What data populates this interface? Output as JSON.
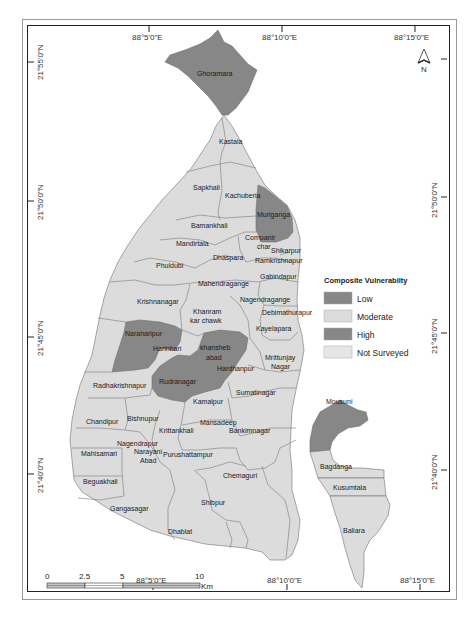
{
  "map": {
    "title": "Composite Vulnerability Map",
    "colors": {
      "low": "#878787",
      "moderate": "#dcdcdc",
      "high": "#878787",
      "not_surveyed": "#e6e6e6",
      "boundary": "#707070",
      "frame": "#222222"
    },
    "axes": {
      "top_longitudes": [
        "88°5'0\"E",
        "88°10'0\"E",
        "88°15'0\"E"
      ],
      "bottom_longitudes": [
        "88°5'0\"E",
        "88°10'0\"E",
        "88°15'0\"E"
      ],
      "left_latitudes": [
        "21°55'0\"N",
        "21°50'0\"N",
        "21°45'0\"N",
        "21°40'0\"N"
      ],
      "right_latitudes": [
        "21°50'0\"N",
        "21°45'0\"N",
        "21°40'0\"N"
      ]
    },
    "north_arrow": {
      "label": "N",
      "icon": "north-arrow-icon"
    },
    "legend": {
      "title": "Composite Vulnerabilty",
      "items": [
        {
          "label": "Low",
          "color": "#878787"
        },
        {
          "label": "Moderate",
          "color": "#dcdcdc"
        },
        {
          "label": "High",
          "color": "#878787"
        },
        {
          "label": "Not Surveyed",
          "color": "#e6e6e6"
        }
      ]
    },
    "scale_bar": {
      "ticks": [
        "0",
        "2.5",
        "5",
        "10"
      ],
      "unit": "Km"
    },
    "regions": {
      "ghoramara": "Ghoramara",
      "kastala": "Kastala",
      "sapkhali": "Sapkhali",
      "kachuberia": "Kachuberia",
      "muriganga": "Muriganga",
      "bamankhali": "Bamankhali",
      "companir_char_1": "Companir",
      "companir_char_2": "char",
      "mandirtala": "Mandirtala",
      "shikarpur": "Shikarpur",
      "ramkrishnapur": "Ramkrishnapur",
      "phuldubi": "Phuldubi",
      "dhaspara": "Dhaspara",
      "gabindapur": "Gabindapur",
      "mahendragange": "Mahendragange",
      "krishnanagar": "Krishnanagar",
      "nagendragange": "Nagendragange",
      "debimathurapur": "Debimathurapur",
      "khanram_1": "Khanram",
      "khanram_2": "kar chawk",
      "kayelapara": "Kayelapara",
      "naraharipur": "Naraharipur",
      "harinbari": "Harinbari",
      "khansheb_1": "khansheb",
      "khansheb_2": "abad",
      "mrittunjay_1": "Mrittunjay",
      "mrittunjay_2": "Nagar",
      "hardhanpur": "Hardhanpur",
      "radhakrishnapur": "Radhakrishnapur",
      "rudranagar": "Rudranagar",
      "sumatinagar": "Sumatinagar",
      "kamalpur": "Kamalpur",
      "chandipur": "Chandipur",
      "bishnupur": "Bishnupur",
      "mansadeep": "Mansadeep",
      "krittankhali": "Krittankhali",
      "bankimnagar": "Bankimnagar",
      "nagendrapur": "Nagendrapur",
      "narayani_1": "Narayani",
      "narayani_2": "Abad",
      "mahisamari": "Mahisamari",
      "purushattampur": "Purushattampur",
      "chemaguri": "Chemaguri",
      "beguakhali": "Beguakhali",
      "gangasagar": "Gangasagar",
      "shibpur": "Shibpur",
      "dhablat": "Dhablat",
      "mousuni": "Mousuni",
      "bagdanga": "Bagdanga",
      "kusumtala": "Kusumtala",
      "baliara": "Baliara"
    }
  }
}
